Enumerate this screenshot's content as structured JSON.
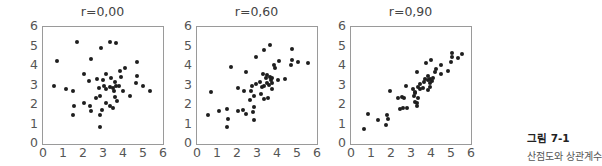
{
  "chart_data": [
    {
      "type": "scatter",
      "title": "r=0.00",
      "xlabel": "",
      "ylabel": "",
      "xlim": [
        0,
        6
      ],
      "ylim": [
        0,
        6
      ],
      "xticks": [
        "0",
        "1",
        "2",
        "3",
        "4",
        "5",
        "6"
      ],
      "yticks": [
        "0",
        "1",
        "2",
        "3",
        "4",
        "5",
        "6"
      ],
      "grid": false,
      "points": [
        [
          1.72,
          5.21
        ],
        [
          3.33,
          5.23
        ],
        [
          3.65,
          5.19
        ],
        [
          2.92,
          4.91
        ],
        [
          0.72,
          4.26
        ],
        [
          2.42,
          4.34
        ],
        [
          4.7,
          4.18
        ],
        [
          4.08,
          3.88
        ],
        [
          3.87,
          3.74
        ],
        [
          2.07,
          3.6
        ],
        [
          3.17,
          3.57
        ],
        [
          3.92,
          3.44
        ],
        [
          4.7,
          3.49
        ],
        [
          2.7,
          3.32
        ],
        [
          3.02,
          3.27
        ],
        [
          3.38,
          3.4
        ],
        [
          2.32,
          3.21
        ],
        [
          3.58,
          3.18
        ],
        [
          4.63,
          3.13
        ],
        [
          0.55,
          2.97
        ],
        [
          3.78,
          2.97
        ],
        [
          3.03,
          2.97
        ],
        [
          3.33,
          2.92
        ],
        [
          3.5,
          2.87
        ],
        [
          3.67,
          2.96
        ],
        [
          2.8,
          2.89
        ],
        [
          3.17,
          2.8
        ],
        [
          4.98,
          2.99
        ],
        [
          1.13,
          2.8
        ],
        [
          1.48,
          2.72
        ],
        [
          3.55,
          2.72
        ],
        [
          4.02,
          2.72
        ],
        [
          5.35,
          2.72
        ],
        [
          2.67,
          2.38
        ],
        [
          2.87,
          2.46
        ],
        [
          3.58,
          2.41
        ],
        [
          4.35,
          2.46
        ],
        [
          3.7,
          2.22
        ],
        [
          2.07,
          2.08
        ],
        [
          3.17,
          2.1
        ],
        [
          2.33,
          1.95
        ],
        [
          3.33,
          1.95
        ],
        [
          1.55,
          1.95
        ],
        [
          3.5,
          1.85
        ],
        [
          2.93,
          1.74
        ],
        [
          2.4,
          1.67
        ],
        [
          1.52,
          1.5
        ],
        [
          2.85,
          1.5
        ],
        [
          2.87,
          0.85
        ]
      ]
    },
    {
      "type": "scatter",
      "title": "r=0.60",
      "xlabel": "",
      "ylabel": "",
      "xlim": [
        0,
        6
      ],
      "ylim": [
        0,
        6
      ],
      "xticks": [
        "0",
        "1",
        "2",
        "3",
        "4",
        "5",
        "6"
      ],
      "yticks": [
        "0",
        "1",
        "2",
        "3",
        "4",
        "5",
        "6"
      ],
      "grid": false,
      "points": [
        [
          3.65,
          5.1
        ],
        [
          3.35,
          4.84
        ],
        [
          4.77,
          4.87
        ],
        [
          2.95,
          4.45
        ],
        [
          4.77,
          4.33
        ],
        [
          4.1,
          4.26
        ],
        [
          5.03,
          4.19
        ],
        [
          5.53,
          4.17
        ],
        [
          3.87,
          4.05
        ],
        [
          1.72,
          3.93
        ],
        [
          3.9,
          3.88
        ],
        [
          4.7,
          4.03
        ],
        [
          2.47,
          3.67
        ],
        [
          3.32,
          3.57
        ],
        [
          3.52,
          3.55
        ],
        [
          3.63,
          3.43
        ],
        [
          3.77,
          3.41
        ],
        [
          3.43,
          3.38
        ],
        [
          3.68,
          3.26
        ],
        [
          4.38,
          3.33
        ],
        [
          4.07,
          3.28
        ],
        [
          3.17,
          3.18
        ],
        [
          3.77,
          3.14
        ],
        [
          2.97,
          3.09
        ],
        [
          3.52,
          3.13
        ],
        [
          3.62,
          3.03
        ],
        [
          3.33,
          3.0
        ],
        [
          2.75,
          2.99
        ],
        [
          3.25,
          2.93
        ],
        [
          2.05,
          2.88
        ],
        [
          3.75,
          2.81
        ],
        [
          0.7,
          2.65
        ],
        [
          2.33,
          2.71
        ],
        [
          2.7,
          2.7
        ],
        [
          3.18,
          2.56
        ],
        [
          2.85,
          2.45
        ],
        [
          3.53,
          2.34
        ],
        [
          3.33,
          2.3
        ],
        [
          2.65,
          2.27
        ],
        [
          1.1,
          1.7
        ],
        [
          1.5,
          1.82
        ],
        [
          2.05,
          1.7
        ],
        [
          2.3,
          1.74
        ],
        [
          2.87,
          1.89
        ],
        [
          2.45,
          1.55
        ],
        [
          2.78,
          1.64
        ],
        [
          0.57,
          1.47
        ],
        [
          1.53,
          1.28
        ],
        [
          2.87,
          1.22
        ],
        [
          1.5,
          0.89
        ]
      ]
    },
    {
      "type": "scatter",
      "title": "r=0.90",
      "xlabel": "",
      "ylabel": "",
      "xlim": [
        0,
        6
      ],
      "ylim": [
        0,
        6
      ],
      "xticks": [
        "0",
        "1",
        "2",
        "3",
        "4",
        "5",
        "6"
      ],
      "yticks": [
        "0",
        "1",
        "2",
        "3",
        "4",
        "5",
        "6"
      ],
      "grid": false,
      "points": [
        [
          5.03,
          4.68
        ],
        [
          5.53,
          4.6
        ],
        [
          5.07,
          4.48
        ],
        [
          5.33,
          4.43
        ],
        [
          5.0,
          4.2
        ],
        [
          4.02,
          4.3
        ],
        [
          3.77,
          4.13
        ],
        [
          4.48,
          4.06
        ],
        [
          4.23,
          3.84
        ],
        [
          4.2,
          3.71
        ],
        [
          4.83,
          3.76
        ],
        [
          4.48,
          3.6
        ],
        [
          3.32,
          3.67
        ],
        [
          3.83,
          3.48
        ],
        [
          4.1,
          3.41
        ],
        [
          3.97,
          3.34
        ],
        [
          3.85,
          3.26
        ],
        [
          3.7,
          3.31
        ],
        [
          4.07,
          3.21
        ],
        [
          3.67,
          3.18
        ],
        [
          3.45,
          3.07
        ],
        [
          3.93,
          3.11
        ],
        [
          2.73,
          2.97
        ],
        [
          3.35,
          2.92
        ],
        [
          3.62,
          2.87
        ],
        [
          3.47,
          2.82
        ],
        [
          3.85,
          2.76
        ],
        [
          3.95,
          2.92
        ],
        [
          1.95,
          2.72
        ],
        [
          3.1,
          2.82
        ],
        [
          3.2,
          2.69
        ],
        [
          3.2,
          2.63
        ],
        [
          3.13,
          2.45
        ],
        [
          2.55,
          2.42
        ],
        [
          2.35,
          2.37
        ],
        [
          3.35,
          2.37
        ],
        [
          2.65,
          2.36
        ],
        [
          3.3,
          2.08
        ],
        [
          3.32,
          1.94
        ],
        [
          3.18,
          2.15
        ],
        [
          2.43,
          1.82
        ],
        [
          2.6,
          1.85
        ],
        [
          2.8,
          1.86
        ],
        [
          0.87,
          1.52
        ],
        [
          1.78,
          1.47
        ],
        [
          1.33,
          1.24
        ],
        [
          1.87,
          1.27
        ],
        [
          1.77,
          0.98
        ],
        [
          0.65,
          0.79
        ]
      ]
    }
  ],
  "panels": [
    {
      "title": "r=0,00"
    },
    {
      "title": "r=0,60"
    },
    {
      "title": "r=0,90"
    }
  ],
  "axis": {
    "x_ticks": [
      "0",
      "1",
      "2",
      "3",
      "4",
      "5",
      "6"
    ],
    "y_ticks": [
      "0",
      "1",
      "2",
      "3",
      "4",
      "5",
      "6"
    ]
  },
  "caption": {
    "label": "그림 7-1",
    "text": "산점도와 상관계수"
  }
}
